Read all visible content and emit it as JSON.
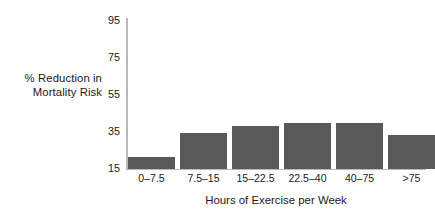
{
  "chart_data": {
    "type": "bar",
    "title": "",
    "subtitle": "",
    "xlabel": "Hours of Exercise per Week",
    "ylabel": "% Reduction in Mortality Risk",
    "ylabel_lines": [
      "% Reduction in",
      "Mortality Risk"
    ],
    "categories": [
      "0–7.5",
      "7.5–15",
      "15–22.5",
      "22.5–40",
      "40–75",
      ">75"
    ],
    "values": [
      21,
      34,
      37.5,
      39,
      39,
      33
    ],
    "ylim": [
      15,
      95
    ],
    "yticks": [
      95,
      75,
      55,
      35,
      15
    ],
    "ytick_labels": [
      "95",
      "75",
      "55",
      "35",
      "15"
    ],
    "grid": false,
    "legend": null,
    "series": [
      {
        "name": "% Reduction in Mortality Risk",
        "values": [
          21,
          34,
          37.5,
          39,
          39,
          33
        ]
      }
    ],
    "colors": {
      "bar_fill": "#5a5a5a",
      "axis": "#b9b9b9",
      "text": "#1a1a1a",
      "background": "#ffffff"
    }
  },
  "axes": {
    "y_title_line1": "% Reduction in",
    "y_title_line2": "Mortality Risk",
    "x_title": "Hours of Exercise per Week"
  }
}
